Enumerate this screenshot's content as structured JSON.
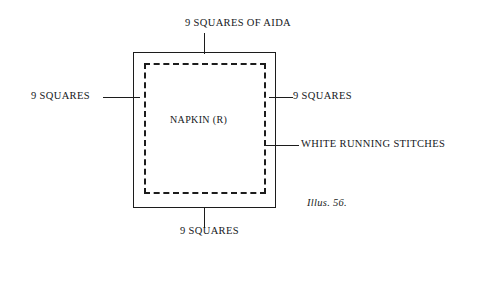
{
  "figure": {
    "caption": "Illus. 56.",
    "center_label": "NAPKIN (R)",
    "labels": {
      "top": "9 SQUARES OF AIDA",
      "bottom": "9 SQUARES",
      "left": "9 SQUARES",
      "right": "9 SQUARES",
      "stitches": "WHITE RUNNING STITCHES"
    },
    "colors": {
      "ink": "#1c1c1c",
      "background": "#ffffff"
    }
  }
}
